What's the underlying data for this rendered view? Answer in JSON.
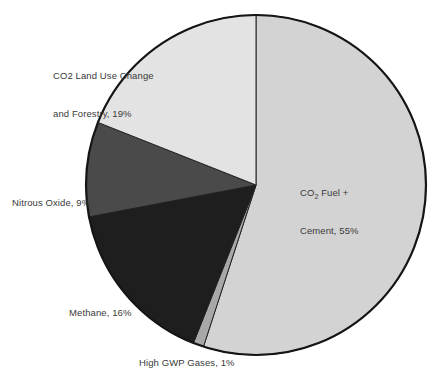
{
  "chart_data": {
    "type": "pie",
    "title": "",
    "subtitle": "",
    "xlabel": "",
    "ylabel": "",
    "legend_position": "none",
    "grid": false,
    "units": "percent",
    "start_angle_deg": 0,
    "direction": "clockwise",
    "categories": [
      "CO2 Fuel + Cement",
      "High GWP Gases",
      "Methane",
      "Nitrous Oxide",
      "CO2 Land Use Change and Forestry"
    ],
    "values": [
      55,
      1,
      16,
      9,
      19
    ],
    "slices": [
      {
        "name": "CO2 Fuel + Cement",
        "value": 55,
        "label_line1": "CO",
        "label_sub1": "2",
        "label_line1_rest": " Fuel +",
        "label_line2": "Cement, 55%",
        "color": "#d3d3d3"
      },
      {
        "name": "High GWP Gases",
        "value": 1,
        "label": "High GWP Gases, 1%",
        "color": "#a8a8a8"
      },
      {
        "name": "Methane",
        "value": 16,
        "label": "Methane, 16%",
        "color": "#1e1e1e"
      },
      {
        "name": "Nitrous Oxide",
        "value": 9,
        "label": "Nitrous Oxide, 9%",
        "color": "#4a4a4a"
      },
      {
        "name": "CO2 Land Use Change and Forestry",
        "value": 19,
        "label_line1": "CO2 Land Use Change",
        "label_line2": "and Forestry, 19%",
        "color": "#e3e3e3"
      }
    ]
  },
  "labels": {
    "landuse_line1": "CO2 Land Use Change",
    "landuse_line2": "and Forestry, 19%",
    "co2fuel_prefix": "CO",
    "co2fuel_sub": "2",
    "co2fuel_suffix": " Fuel +",
    "co2fuel_line2": "Cement, 55%",
    "nitrous": "Nitrous Oxide, 9%",
    "methane": "Methane, 16%",
    "highgwp": "High GWP Gases, 1%"
  },
  "colors": {
    "co2_fuel_cement": "#d3d3d3",
    "high_gwp": "#a8a8a8",
    "methane": "#1e1e1e",
    "nitrous_oxide": "#4a4a4a",
    "land_use": "#e3e3e3",
    "outline": "#151515",
    "text": "#3a3a3a",
    "background": "#ffffff"
  },
  "geometry": {
    "center_x": 256,
    "center_y": 185,
    "radius": 170
  }
}
